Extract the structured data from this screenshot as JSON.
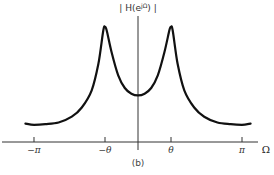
{
  "figure": {
    "caption": "(b)"
  },
  "chart_data": {
    "type": "line",
    "title": "",
    "ylabel": "| H(e^{jΩ}) |",
    "ylabel_display": "| H(e",
    "ylabel_sup": "jΩ",
    "ylabel_tail": ") |",
    "xlabel": "Ω",
    "xticks": [
      {
        "label": "−π",
        "value": -3.1416
      },
      {
        "label": "−θ",
        "value": -1.0
      },
      {
        "label": "θ",
        "value": 1.0
      },
      {
        "label": "π",
        "value": 3.1416
      }
    ],
    "xlim": [
      -3.5,
      3.5
    ],
    "ylim": [
      0,
      1.1
    ],
    "grid": false,
    "legend": null,
    "series": [
      {
        "name": "|H(e^{jΩ})|",
        "x": [
          -3.4,
          -3.14,
          -2.8,
          -2.4,
          -2.0,
          -1.7,
          -1.4,
          -1.2,
          -1.05,
          -1.0,
          -0.95,
          -0.8,
          -0.6,
          -0.4,
          -0.2,
          0.0,
          0.2,
          0.4,
          0.6,
          0.8,
          0.95,
          1.0,
          1.05,
          1.2,
          1.4,
          1.7,
          2.0,
          2.4,
          2.8,
          3.14,
          3.4
        ],
        "y": [
          0.16,
          0.15,
          0.155,
          0.17,
          0.22,
          0.3,
          0.45,
          0.68,
          0.97,
          1.0,
          0.97,
          0.78,
          0.58,
          0.47,
          0.42,
          0.405,
          0.42,
          0.47,
          0.58,
          0.78,
          0.97,
          1.0,
          0.97,
          0.68,
          0.45,
          0.3,
          0.22,
          0.17,
          0.155,
          0.15,
          0.16
        ]
      }
    ]
  },
  "colors": {
    "curve": "#111111",
    "axis": "#333333",
    "background": "#ffffff"
  }
}
